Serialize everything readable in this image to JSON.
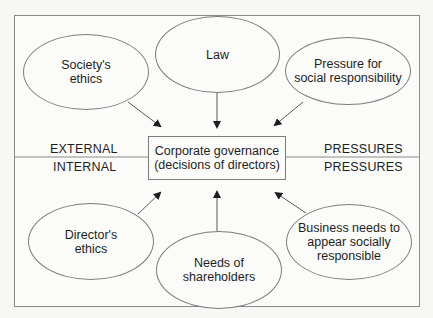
{
  "diagram": {
    "center": {
      "label": "Corporate governance\n(decisions of directors)"
    },
    "zones": {
      "external_left": "EXTERNAL",
      "external_right": "PRESSURES",
      "internal_left": "INTERNAL",
      "internal_right": "PRESSURES"
    },
    "external_pressures": [
      {
        "id": "society-ethics",
        "label": "Society's\nethics"
      },
      {
        "id": "law",
        "label": "Law"
      },
      {
        "id": "pressure-social-responsibility",
        "label": "Pressure for\nsocial responsibility"
      }
    ],
    "internal_pressures": [
      {
        "id": "directors-ethics",
        "label": "Director's\nethics"
      },
      {
        "id": "needs-of-shareholders",
        "label": "Needs of\nshareholders"
      },
      {
        "id": "business-needs",
        "label": "Business needs to\nappear socially\nresponsible"
      }
    ],
    "edges": [
      {
        "from": "society-ethics",
        "to": "center"
      },
      {
        "from": "law",
        "to": "center"
      },
      {
        "from": "pressure-social-responsibility",
        "to": "center"
      },
      {
        "from": "directors-ethics",
        "to": "center"
      },
      {
        "from": "needs-of-shareholders",
        "to": "center"
      },
      {
        "from": "business-needs",
        "to": "center"
      }
    ],
    "colors": {
      "stroke": "#7c7c7c",
      "background": "#fbfbfa",
      "text": "#1e1e1e"
    }
  }
}
